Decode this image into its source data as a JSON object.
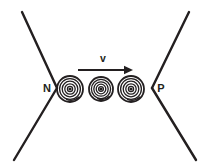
{
  "figure": {
    "background_color": "#ffffff",
    "ink_color": "#231f20",
    "width": 203,
    "height": 168
  },
  "labels": {
    "left_region": "N",
    "right_region": "P",
    "velocity": "v"
  },
  "regions": {
    "left": {
      "name": "n-type region",
      "label": "N",
      "label_x": 47,
      "label_y": 92,
      "vertex_x": 57,
      "vertex_y": 88,
      "top_end_x": 22,
      "top_end_y": 12,
      "bottom_end_x": 14,
      "bottom_end_y": 160
    },
    "right": {
      "name": "p-type region",
      "label": "P",
      "label_x": 161,
      "label_y": 92,
      "vertex_x": 152,
      "vertex_y": 88,
      "top_end_x": 189,
      "top_end_y": 12,
      "bottom_end_x": 196,
      "bottom_end_y": 160
    }
  },
  "vortices": [
    {
      "name": "vortex-left",
      "cx": 70,
      "cy": 89,
      "radius": 13,
      "rings": 5
    },
    {
      "name": "vortex-middle",
      "cx": 101,
      "cy": 89,
      "radius": 12,
      "rings": 5
    },
    {
      "name": "vortex-right",
      "cx": 131,
      "cy": 89,
      "radius": 13,
      "rings": 5
    }
  ],
  "arrow": {
    "name": "velocity-arrow",
    "label": "v",
    "label_x": 103,
    "label_y": 62,
    "start_x": 78,
    "end_x": 133,
    "y": 70,
    "direction": "right"
  }
}
